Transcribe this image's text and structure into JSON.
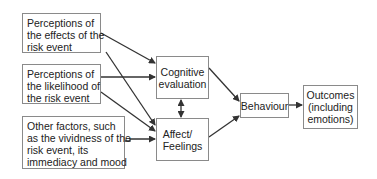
{
  "diagram": {
    "inputs": [
      {
        "id": "effects",
        "lines": [
          "Perceptions of",
          "the effects of the",
          "risk event"
        ]
      },
      {
        "id": "likelihood",
        "lines": [
          "Perceptions of",
          "the likelihood of",
          "the risk event"
        ]
      },
      {
        "id": "other",
        "lines": [
          "Other factors, such",
          "as the vividness of the",
          "risk event, its",
          "immediacy and mood"
        ]
      }
    ],
    "cognitive": {
      "lines": [
        "Cognitive",
        "evaluation"
      ]
    },
    "affect": {
      "lines": [
        "Affect/",
        "Feelings"
      ]
    },
    "behaviour": {
      "label": "Behaviour"
    },
    "outcomes": {
      "lines": [
        "Outcomes",
        "(including",
        "emotions)"
      ]
    },
    "edges": [
      {
        "from": "effects",
        "to": "cognitive"
      },
      {
        "from": "effects",
        "to": "affect"
      },
      {
        "from": "likelihood",
        "to": "cognitive"
      },
      {
        "from": "likelihood",
        "to": "affect"
      },
      {
        "from": "other",
        "to": "affect"
      },
      {
        "from": "cognitive",
        "to": "affect",
        "bidirectional": true
      },
      {
        "from": "cognitive",
        "to": "behaviour"
      },
      {
        "from": "affect",
        "to": "behaviour"
      },
      {
        "from": "behaviour",
        "to": "outcomes"
      }
    ],
    "colors": {
      "border": "#8a8a8a",
      "arrow": "#333333",
      "text": "#222222"
    }
  }
}
